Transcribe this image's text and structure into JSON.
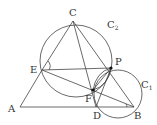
{
  "diagram": {
    "type": "geometry",
    "stroke_color": "#444444",
    "points": [
      {
        "name": "C",
        "x": 73,
        "y": 21,
        "label_x": 69,
        "label_y": 16
      },
      {
        "name": "E",
        "x": 42,
        "y": 70,
        "label_x": 30,
        "label_y": 73
      },
      {
        "name": "P",
        "x": 111,
        "y": 68,
        "label_x": 115,
        "label_y": 65
      },
      {
        "name": "F",
        "x": 93,
        "y": 90,
        "label_x": 85,
        "label_y": 102
      },
      {
        "name": "D",
        "x": 96,
        "y": 107,
        "label_x": 93,
        "label_y": 119
      },
      {
        "name": "B",
        "x": 134,
        "y": 107,
        "label_x": 134,
        "label_y": 119
      },
      {
        "name": "A",
        "x": 20,
        "y": 107,
        "label_x": 8,
        "label_y": 112
      }
    ],
    "circles": [
      {
        "name": "C",
        "subscript": "2",
        "cx": 76,
        "cy": 61,
        "r": 36,
        "label_x": 107,
        "label_y": 28
      },
      {
        "name": "C",
        "subscript": "1",
        "cx": 118,
        "cy": 94,
        "r": 24,
        "label_x": 141,
        "label_y": 88
      }
    ]
  }
}
